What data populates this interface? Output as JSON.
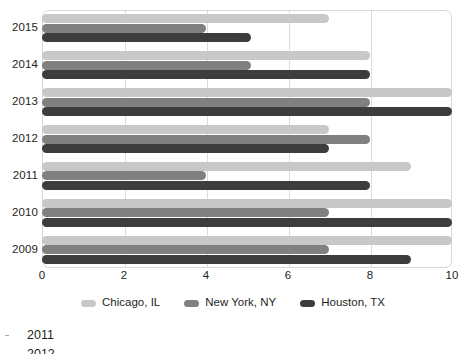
{
  "chart_data": {
    "type": "bar",
    "orientation": "horizontal",
    "title": "",
    "xlabel": "",
    "ylabel": "",
    "categories": [
      "2015",
      "2014",
      "2013",
      "2012",
      "2011",
      "2010",
      "2009"
    ],
    "series": [
      {
        "name": "Chicago, IL",
        "color": "#c8c8c8",
        "values": [
          7,
          8,
          10,
          7,
          9,
          10,
          10
        ]
      },
      {
        "name": "New York, NY",
        "color": "#808080",
        "values": [
          4,
          5.1,
          8,
          8,
          4,
          7,
          7
        ]
      },
      {
        "name": "Houston, TX",
        "color": "#3d3d3d",
        "values": [
          5.1,
          8,
          10,
          7,
          8,
          10,
          9
        ]
      }
    ],
    "xlim": [
      0,
      10
    ],
    "xticks": [
      "0",
      "2",
      "4",
      "6",
      "8",
      "10"
    ],
    "xtick_values": [
      0,
      2,
      4,
      6,
      8,
      10
    ],
    "yticks": [
      "2015",
      "2014",
      "2013",
      "2012",
      "2011",
      "2010",
      "2009"
    ],
    "grid": "vertical",
    "legend_position": "bottom"
  },
  "footer": {
    "items": [
      {
        "label": "2011"
      },
      {
        "label": "2012"
      }
    ]
  }
}
